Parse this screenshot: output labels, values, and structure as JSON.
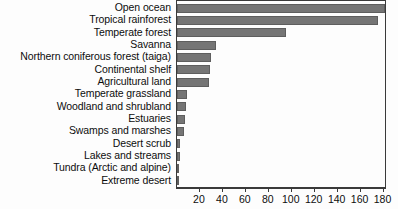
{
  "chart_data": {
    "type": "bar",
    "orientation": "horizontal",
    "title": "",
    "xlabel": "",
    "ylabel": "",
    "categories": [
      "Open ocean",
      "Tropical rainforest",
      "Temperate forest",
      "Savanna",
      "Northern coniferous forest (taiga)",
      "Continental shelf",
      "Agricultural land",
      "Temperate grassland",
      "Woodland and shrubland",
      "Estuaries",
      "Swamps and marshes",
      "Desert scrub",
      "Lakes and streams",
      "Tundra (Arctic and alpine)",
      "Extreme desert"
    ],
    "values": [
      183,
      175,
      95,
      34,
      30,
      29,
      28,
      9,
      8,
      7,
      6,
      3,
      2.5,
      2,
      1
    ],
    "xlim": [
      0,
      183
    ],
    "xticks": [
      20,
      40,
      60,
      80,
      100,
      120,
      140,
      160,
      180
    ],
    "xticklabels": [
      "20",
      "40",
      "60",
      "80",
      "100",
      "120",
      "140",
      "160",
      "180"
    ],
    "grid": false,
    "legend": null,
    "bar_color": "#757575",
    "bar_edge_color": "#5e5e5e",
    "axis_color": "#3a3a3a",
    "text_color": "#0d0d0d",
    "background_color": "#fdfdfd"
  }
}
